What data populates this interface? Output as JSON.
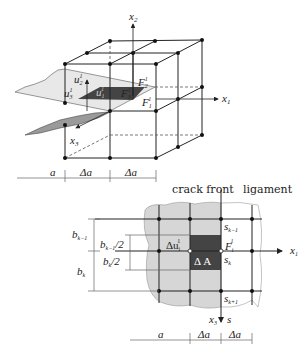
{
  "colors": {
    "line": "#222222",
    "crack_light": "#e6e6e6",
    "crack_mid": "#9a9a9a",
    "element_dark": "#444444",
    "dim_line": "#666666",
    "text_on_dark": "#ffffff"
  },
  "top_diagram": {
    "axes": {
      "x1": "x",
      "x1_sub": "1",
      "x2": "x",
      "x2_sub": "2",
      "x3": "x",
      "x3_sub": "3"
    },
    "labels": {
      "u2": "u",
      "u2_sub": "2",
      "u2_sup": "1",
      "u3": "u",
      "u3_sub": "3",
      "u3_sup": "1",
      "u1": "u",
      "u1_sub": "1",
      "u1_sup": "1",
      "F2": "F",
      "F2_sub": "2",
      "F2_sup": "1",
      "F3": "F",
      "F3_sub": "3",
      "F3_sup": "1",
      "F1": "F",
      "F1_sub": "1",
      "F1_sup": "1"
    },
    "dimensions": [
      "a",
      "Δa",
      "Δa"
    ]
  },
  "bottom_diagram": {
    "titles": {
      "crack_front": "crack front",
      "ligament": "ligament"
    },
    "labels": {
      "du": "Δu",
      "du_sub": "i",
      "du_sup": "1",
      "F": "F",
      "F_sub": "i",
      "F_sup": "1",
      "dA": "Δ A",
      "s_km1": "s",
      "s_km1_sub": "k−1",
      "s_k": "s",
      "s_k_sub": "k",
      "s_kp1": "s",
      "s_kp1_sub": "k+1",
      "x1": "x",
      "x1_sub": "1",
      "x3": "x",
      "x3_sub": "3",
      "s": "s"
    },
    "left_dims": {
      "b_km1": "b",
      "b_km1_sub": "k−1",
      "b_k": "b",
      "b_k_sub": "k",
      "b_km1_half": "/2",
      "b_k_half": "/2"
    },
    "dimensions": [
      "a",
      "Δa",
      "Δa"
    ]
  }
}
